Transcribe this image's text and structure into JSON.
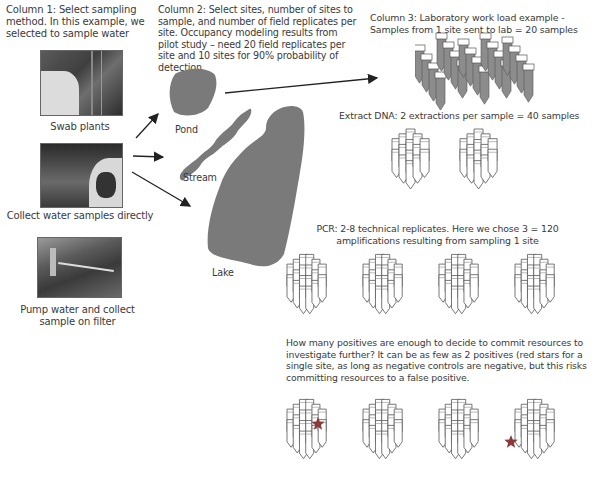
{
  "column1": {
    "heading": "Column 1: Select sampling method. In this example, we selected to sample water",
    "methods": [
      {
        "label": "Swab plants",
        "image": "photo-swab-plants"
      },
      {
        "label": "Collect water samples directly",
        "image": "photo-collect-water"
      },
      {
        "label": "Pump water and collect sample on filter",
        "image": "photo-pump-water"
      }
    ]
  },
  "column2": {
    "heading": "Column 2: Select sites, number of sites to sample, and number of field replicates per site. Occupancy modeling results from pilot study – need 20 field replicates per site and 10 sites for 90% probability of detection",
    "sites": [
      {
        "label": "Pond",
        "color": "#7a7a7a"
      },
      {
        "label": "Stream",
        "color": "#7a7a7a"
      },
      {
        "label": "Lake",
        "color": "#7a7a7a"
      }
    ]
  },
  "column3": {
    "heading": "Column 3: Laboratory work load example - Samples from 1 site sent to lab = 20 samples",
    "samples_count": 20,
    "extract": {
      "label": "Extract DNA: 2 extractions per sample = 40 samples",
      "count": 40,
      "clusters": 2
    },
    "pcr": {
      "label": "PCR: 2-8 technical replicates. Here we chose 3 = 120 amplifications resulting from sampling 1 site",
      "count": 120,
      "clusters": 4
    },
    "positives": {
      "label": "How many positives are enough to decide to commit resources to investigate further? It can be as few as 2 positives (red stars for a single site, as long as negative controls are negative, but this risks committing resources to a false positive.",
      "star_count": 2,
      "star_color": "#8a3a3a"
    }
  },
  "colors": {
    "water": "#7a7a7a",
    "tube_fill": "#8c8c8c",
    "tube_outline": "#555555",
    "arrow": "#222222"
  }
}
